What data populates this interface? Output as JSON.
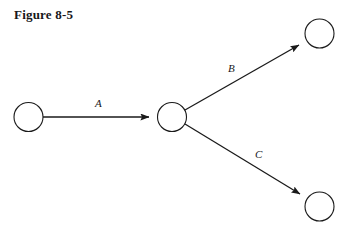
{
  "figure": {
    "caption": "Figure 8-5",
    "background_color": "#ffffff",
    "ink_color": "#1a1a1a"
  },
  "diagram": {
    "type": "directed-graph",
    "node_radius": 14.5,
    "stroke_width": 1.1,
    "nodes": [
      {
        "id": "n1",
        "name": "source-node",
        "label": "",
        "cx": 28.5,
        "cy": 117
      },
      {
        "id": "n2",
        "name": "junction-node",
        "label": "",
        "cx": 172,
        "cy": 117
      },
      {
        "id": "n3",
        "name": "upper-target-node",
        "label": "",
        "cx": 319.5,
        "cy": 33.5
      },
      {
        "id": "n4",
        "name": "lower-target-node",
        "label": "",
        "cx": 319.5,
        "cy": 206.5
      }
    ],
    "edges": [
      {
        "id": "e1",
        "name": "edge-a",
        "label": "A",
        "from": "n1",
        "to": "n2",
        "x1": 43,
        "y1": 117,
        "x2": 157,
        "y2": 117,
        "label_x": 95,
        "label_y": 107
      },
      {
        "id": "e2",
        "name": "edge-b",
        "label": "B",
        "from": "n2",
        "to": "n3",
        "x1": 185,
        "y1": 110,
        "x2": 306,
        "y2": 41,
        "label_x": 228,
        "label_y": 72
      },
      {
        "id": "e3",
        "name": "edge-c",
        "label": "C",
        "from": "n2",
        "to": "n4",
        "x1": 185,
        "y1": 124,
        "x2": 307,
        "y2": 198,
        "label_x": 255,
        "label_y": 158
      }
    ]
  }
}
